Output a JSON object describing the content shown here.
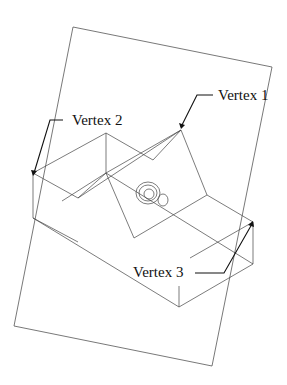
{
  "diagram": {
    "type": "isometric wireframe of block with notch, inside tilted cutting plane",
    "colors": {
      "line": "#444444",
      "label": "#111111",
      "background": "#ffffff"
    },
    "labels": [
      {
        "id": "vertex-1",
        "text": "Vertex 1"
      },
      {
        "id": "vertex-2",
        "text": "Vertex 2"
      },
      {
        "id": "vertex-3",
        "text": "Vertex 3"
      }
    ]
  }
}
